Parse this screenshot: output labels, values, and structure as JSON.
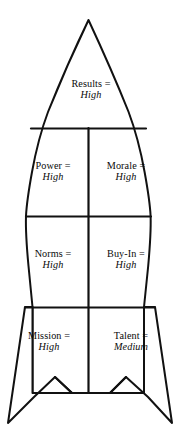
{
  "diagram": {
    "shape": "rocket-with-fins",
    "stroke_color": "#111111",
    "fill_color": "#ffffff",
    "background_color": "#ffffff",
    "compartments": [
      {
        "id": "results",
        "region": "nose-cone",
        "metric": "Results =",
        "value": "High"
      },
      {
        "id": "power",
        "region": "upper-left",
        "metric": "Power =",
        "value": "High"
      },
      {
        "id": "morale",
        "region": "upper-right",
        "metric": "Morale =",
        "value": "High"
      },
      {
        "id": "norms",
        "region": "middle-left",
        "metric": "Norms =",
        "value": "High"
      },
      {
        "id": "buyin",
        "region": "middle-right",
        "metric": "Buy-In =",
        "value": "High"
      },
      {
        "id": "mission",
        "region": "lower-left",
        "metric": "Mission =",
        "value": "High"
      },
      {
        "id": "talent",
        "region": "lower-right",
        "metric": "Talent =",
        "value": "Medium"
      }
    ]
  }
}
